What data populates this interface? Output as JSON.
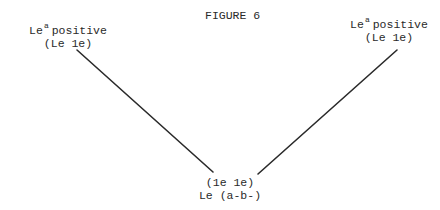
{
  "figure": {
    "title": "FIGURE 6"
  },
  "nodes": {
    "top_left": {
      "label_main": "Le",
      "label_sup": "a",
      "label_rest": "positive",
      "sublabel": "(Le 1e)"
    },
    "top_right": {
      "label_main": "Le",
      "label_sup": "a",
      "label_rest": "positive",
      "sublabel": "(Le 1e)"
    },
    "bottom": {
      "line1": "(1e 1e)",
      "line2": "Le (a-b-)"
    }
  },
  "edges": [
    {
      "from": "top_left",
      "to": "bottom",
      "x1": 77,
      "y1": 50,
      "x2": 213,
      "y2": 172
    },
    {
      "from": "top_right",
      "to": "bottom",
      "x1": 397,
      "y1": 50,
      "x2": 258,
      "y2": 174
    }
  ],
  "colors": {
    "ink": "#2a2a2a",
    "background": "#ffffff"
  }
}
